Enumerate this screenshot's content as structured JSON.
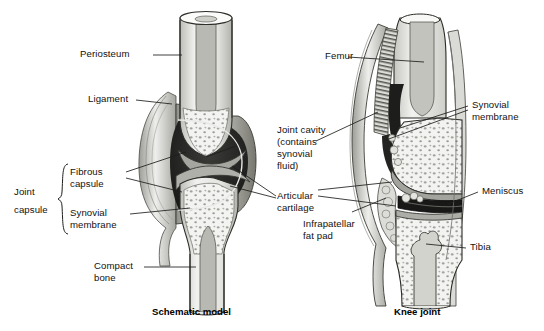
{
  "figure": {
    "title_left": "Schematic model",
    "title_right": "Knee joint",
    "type": "anatomical-illustration",
    "style": "grayscale cut-away cross-section, stippled spongy bone",
    "palette": {
      "background": "#ffffff",
      "line": "#1a1a18",
      "bone_compact": "#e9e9e6",
      "bone_spongy": "#f2f2f0",
      "stipple": "#9d9d98",
      "cartilage": "#a0a09b",
      "capsule_fibrous": "#6f6f6a",
      "cavity_dark": "#262624",
      "cavity_deep": "#111110",
      "fat_pad": "#d8d8d4",
      "membrane": "#bdbdb8",
      "text": "#111111"
    }
  },
  "left_panel": {
    "name": "Schematic model",
    "caption": "Schematic model",
    "group_bracket_label": "Joint\ncapsule",
    "labels": [
      {
        "id": "periosteum",
        "text": "Periosteum",
        "side": "left"
      },
      {
        "id": "ligament",
        "text": "Ligament",
        "side": "left"
      },
      {
        "id": "fibrous-capsule",
        "text": "Fibrous\ncapsule",
        "side": "left"
      },
      {
        "id": "synovial-membrane",
        "text": "Synovial\nmembrane",
        "side": "left"
      },
      {
        "id": "compact-bone",
        "text": "Compact\nbone",
        "side": "left"
      }
    ]
  },
  "center_labels": [
    {
      "id": "joint-cavity",
      "text": "Joint cavity\n(contains\nsynovial\nfluid)"
    },
    {
      "id": "articular-cartilage",
      "text": "Articular\ncartilage"
    },
    {
      "id": "infrapatellar-fat-pad",
      "text": "Infrapatellar\nfat pad"
    }
  ],
  "right_panel": {
    "name": "Knee joint",
    "caption": "Knee joint",
    "labels": [
      {
        "id": "femur",
        "text": "Femur",
        "side": "left"
      },
      {
        "id": "synovial-membrane",
        "text": "Synovial\nmembrane",
        "side": "right"
      },
      {
        "id": "meniscus",
        "text": "Meniscus",
        "side": "right"
      },
      {
        "id": "tibia",
        "text": "Tibia",
        "side": "right"
      }
    ]
  },
  "text": {
    "periosteum": "Periosteum",
    "ligament": "Ligament",
    "fibrous_l1": "Fibrous",
    "fibrous_l2": "capsule",
    "synmem_l1": "Synovial",
    "synmem_l2": "membrane",
    "compact_l1": "Compact",
    "compact_l2": "bone",
    "jointcap_l1": "Joint",
    "jointcap_l2": "capsule",
    "cavity_l1": "Joint cavity",
    "cavity_l2": "(contains",
    "cavity_l3": "synovial",
    "cavity_l4": "fluid)",
    "artic_l1": "Articular",
    "artic_l2": "cartilage",
    "fat_l1": "Infrapatellar",
    "fat_l2": "fat pad",
    "femur": "Femur",
    "rsynmem_l1": "Synovial",
    "rsynmem_l2": "membrane",
    "meniscus": "Meniscus",
    "tibia": "Tibia",
    "cap_left": "Schematic model",
    "cap_right": "Knee joint"
  }
}
